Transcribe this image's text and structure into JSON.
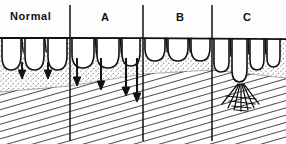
{
  "figure": {
    "type": "medical-illustration",
    "width": 286,
    "height": 144,
    "background_color": "#fdfdfd",
    "ink_color": "#111111"
  },
  "labels": {
    "normal": "Normal",
    "a": "A",
    "b": "B",
    "c": "C"
  },
  "dividers": [
    {
      "name": "divider-normal-a",
      "x": 70,
      "y1": 5,
      "y2": 141
    },
    {
      "name": "divider-a-b",
      "x": 143,
      "y1": 5,
      "y2": 141
    },
    {
      "name": "divider-b-c",
      "x": 212,
      "y1": 5,
      "y2": 141
    }
  ],
  "regions": [
    {
      "key": "normal",
      "label": "Normal",
      "x_start": 0,
      "x_end": 70,
      "villus_count": 3,
      "villus_height": 30,
      "villus_width": 22,
      "crypt_depth": 10,
      "description": "tall slender finger-like villi with shallow crypts"
    },
    {
      "key": "a",
      "label": "A",
      "x_start": 70,
      "x_end": 143,
      "villus_count": 3,
      "villus_height": 26,
      "villus_width": 24,
      "crypt_depth": 18,
      "description": "broadened shortened villi, deepening crypts"
    },
    {
      "key": "b",
      "label": "B",
      "x_start": 143,
      "x_end": 212,
      "villus_count": 3,
      "villus_height": 17,
      "villus_width": 23,
      "crypt_depth": 26,
      "description": "short ridged villi, markedly elongated crypts"
    },
    {
      "key": "c",
      "label": "C",
      "x_start": 212,
      "x_end": 286,
      "villus_count": 3,
      "villus_height": 5,
      "villus_width": 22,
      "crypt_depth": 34,
      "description": "flat atrophic mucosa, crypt hyperplasia, inflammatory infiltrate"
    }
  ],
  "arrows": [
    {
      "name": "crypt-depth-arrow-1",
      "x": 22,
      "y_top": 62,
      "y_bottom": 76
    },
    {
      "name": "crypt-depth-arrow-2",
      "x": 48,
      "y_top": 62,
      "y_bottom": 76
    },
    {
      "name": "crypt-depth-arrow-3",
      "x": 77,
      "y_top": 58,
      "y_bottom": 84
    },
    {
      "name": "crypt-depth-arrow-4",
      "x": 101,
      "y_top": 58,
      "y_bottom": 88
    },
    {
      "name": "crypt-depth-arrow-5",
      "x": 126,
      "y_top": 58,
      "y_bottom": 94
    },
    {
      "name": "crypt-depth-arrow-6",
      "x": 136,
      "y_top": 58,
      "y_bottom": 100
    }
  ],
  "layers": [
    {
      "name": "lamina-propria-stipple",
      "pattern": "stipple",
      "note": "light dotted layer beneath epithelium"
    },
    {
      "name": "submucosa-hatch",
      "pattern": "diagonal-hatch",
      "note": "parallel diagonal line fill sloping up to the right"
    },
    {
      "name": "inflammatory-infiltrate",
      "pattern": "cross-hatch-fan",
      "note": "dense crosshatched fan under region C crypts"
    }
  ],
  "surface_line": {
    "name": "mucosal-surface-line",
    "y_left": 38,
    "y_right": 40
  }
}
